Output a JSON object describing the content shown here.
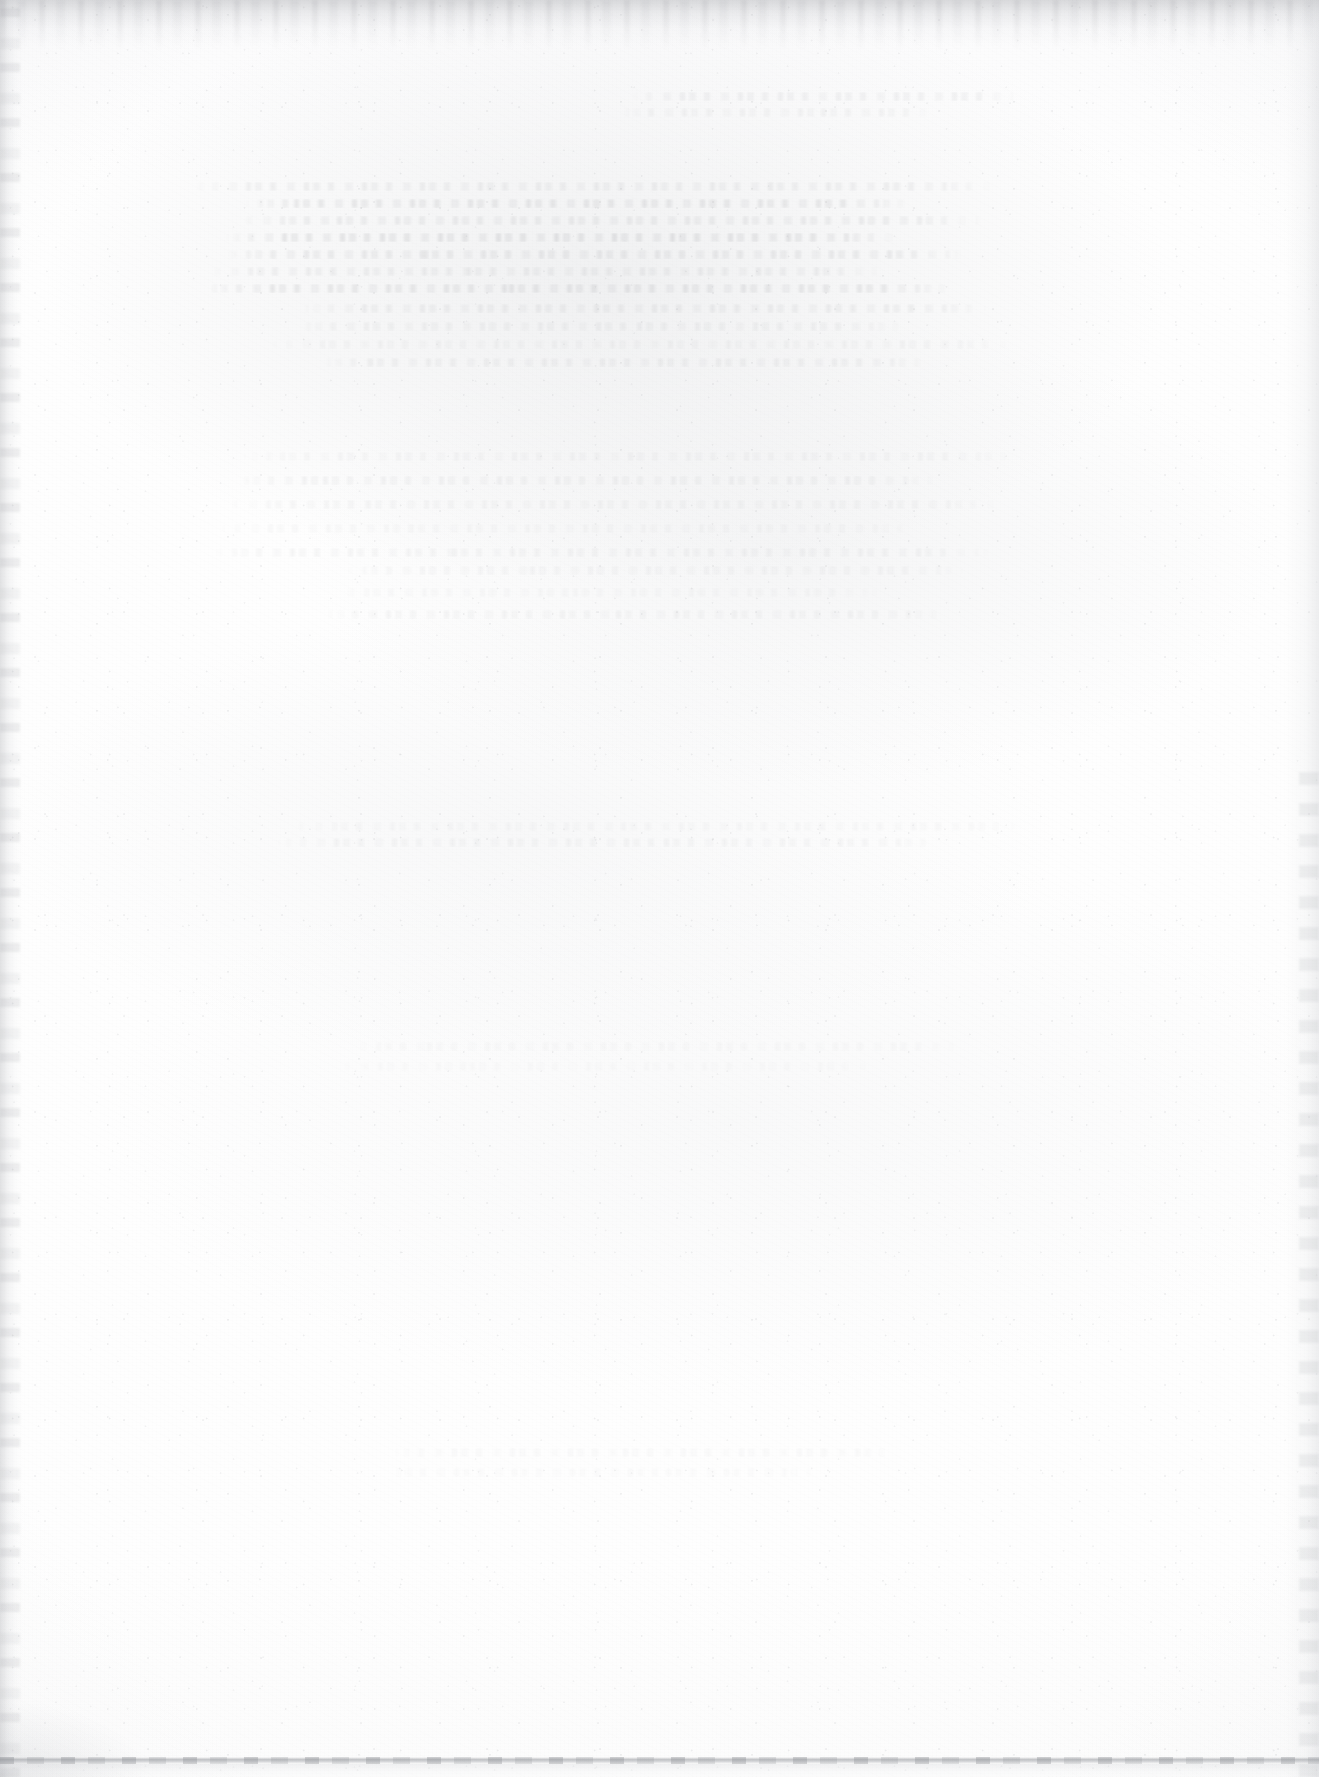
{
  "document": {
    "kind": "scanned-page",
    "description": "Blank scanned page",
    "content_text": "",
    "page_width_px": 1319,
    "page_height_px": 1777,
    "orientation": "portrait",
    "visible_text_present": false
  },
  "colors": {
    "paper": "#fdfdfd",
    "paper_highlight": "#fefefe",
    "paper_shadow": "#fafafa",
    "ghost_ink": "#60636a",
    "edge_shadow": "#8f9298",
    "edge_light": "#d4d6da"
  },
  "artifacts": {
    "top_edge_band": "scanner-edge-shadow-top",
    "left_edge_band": "scanner-edge-shadow-left",
    "right_edge_band": "scanner-edge-shadow-right",
    "bottom_edge_line": "scanner-edge-line-bottom",
    "grain": "paper-fiber-texture",
    "speckle": "dust-and-noise-speckle",
    "vignette": "corner-vignette"
  },
  "bleed_through": {
    "label": "show-through ghosting from reverse side of sheet",
    "legible": false,
    "clusters": [
      {
        "name": "upper-paragraph-ghost",
        "x": 188,
        "y": 182,
        "width": 812,
        "line_count": 7,
        "line_gap": 17,
        "opacity": 0.5
      },
      {
        "name": "upper-right-ghost",
        "x": 612,
        "y": 92,
        "width": 420,
        "line_count": 2,
        "line_gap": 16,
        "opacity": 0.34
      },
      {
        "name": "mid-upper-ghost",
        "x": 262,
        "y": 304,
        "width": 760,
        "line_count": 4,
        "line_gap": 18,
        "opacity": 0.3
      },
      {
        "name": "mid-ghost-streaks",
        "x": 200,
        "y": 452,
        "width": 828,
        "line_count": 5,
        "line_gap": 24,
        "opacity": 0.24
      },
      {
        "name": "lower-mid-ghost",
        "x": 284,
        "y": 566,
        "width": 700,
        "line_count": 3,
        "line_gap": 22,
        "opacity": 0.2
      },
      {
        "name": "center-streak-ghost",
        "x": 272,
        "y": 822,
        "width": 790,
        "line_count": 2,
        "line_gap": 16,
        "opacity": 0.22
      },
      {
        "name": "faint-low-ghost",
        "x": 330,
        "y": 1042,
        "width": 640,
        "line_count": 2,
        "line_gap": 20,
        "opacity": 0.14
      },
      {
        "name": "faint-bottom-ghost",
        "x": 360,
        "y": 1448,
        "width": 560,
        "line_count": 2,
        "line_gap": 20,
        "opacity": 0.12
      }
    ]
  }
}
